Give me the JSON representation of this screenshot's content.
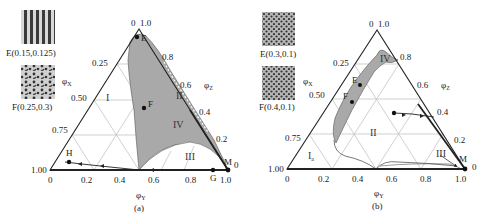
{
  "figure": {
    "panels": [
      {
        "id": "a",
        "caption": "(a)",
        "insets": [
          {
            "label": "E(0.15,0.125)",
            "pattern": "lamellar-stripes"
          },
          {
            "label": "F(0.25,0.3)",
            "pattern": "mixed-dots-worms"
          }
        ],
        "axes": {
          "x_label": "φY",
          "left_label": "φX",
          "right_label": "φZ",
          "apex_labels": [
            "0",
            "1.0"
          ],
          "bottom_ticks": [
            "0",
            "0.2",
            "0.4",
            "0.6",
            "0.8",
            "1.0"
          ],
          "left_ticks": [
            "0.25",
            "0.50",
            "0.75",
            "1.00"
          ],
          "right_ticks": [
            "0.8",
            "0.6",
            "0.4",
            "0.2",
            "0"
          ]
        },
        "regions": [
          "I",
          "II",
          "III",
          "IV"
        ],
        "points": [
          "E",
          "F",
          "H",
          "G",
          "M"
        ]
      },
      {
        "id": "b",
        "caption": "(b)",
        "insets": [
          {
            "label": "E(0.3,0.1)",
            "pattern": "hexagonal-dots"
          },
          {
            "label": "F(0.4,0.1)",
            "pattern": "hexagonal-dots"
          }
        ],
        "axes": {
          "x_label": "φY",
          "left_label": "φX",
          "right_label": "φZ",
          "apex_labels": [
            "0",
            "1.0"
          ],
          "bottom_ticks": [
            "0",
            "0.2",
            "0.4",
            "0.6",
            "0.8",
            "1.0"
          ],
          "left_ticks": [
            "0.25",
            "0.50",
            "0.75",
            "1.00"
          ],
          "right_ticks": [
            "0.8",
            "0.6",
            "0.4",
            "0.2",
            "0"
          ]
        },
        "regions": [
          "Ia",
          "II",
          "III",
          "IV"
        ],
        "points": [
          "E",
          "F",
          "M"
        ]
      }
    ],
    "colors": {
      "shaded_region": "#a9a9a9",
      "line": "#222222",
      "grid": "#b8b8b8"
    }
  },
  "text": {
    "a_caption": "(a)",
    "b_caption": "(b)",
    "a_inset1": "E(0.15,0.125)",
    "a_inset2": "F(0.25,0.3)",
    "b_inset1": "E(0.3,0.1)",
    "b_inset2": "F(0.4,0.1)",
    "phi_x": "φ",
    "phi_x_sub": "X",
    "phi_y": "φ",
    "phi_y_sub": "Y",
    "phi_z": "φ",
    "phi_z_sub": "Z",
    "apex0": "0",
    "apex1": "1.0",
    "b0": "0",
    "b2": "0.2",
    "b4": "0.4",
    "b6": "0.6",
    "b8": "0.8",
    "b10": "1.0",
    "l25": "0.25",
    "l50": "0.50",
    "l75": "0.75",
    "l100": "1.00",
    "r8": "0.8",
    "r6": "0.6",
    "r4": "0.4",
    "r2": "0.2",
    "r0": "0",
    "rI": "I",
    "rII": "II",
    "rIII": "III",
    "rIV": "IV",
    "rIa": "I",
    "rIa_sub": "a",
    "pE": "E",
    "pF": "F",
    "pH": "H",
    "pG": "G",
    "pM": "M"
  }
}
